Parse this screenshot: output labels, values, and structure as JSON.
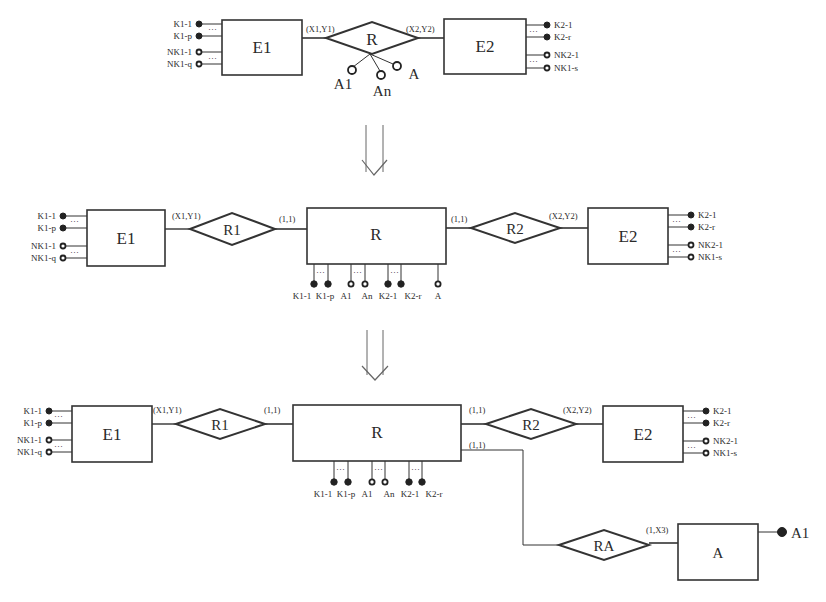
{
  "diagram": {
    "type": "ER schema transformation",
    "stage1": {
      "entity1": "E1",
      "entity2": "E2",
      "relationship": "R",
      "card_left": "(X1,Y1)",
      "card_right": "(X2,Y2)",
      "rel_attrs": [
        "A1",
        "An",
        "A"
      ],
      "e1_attrs": [
        "K1-1",
        "K1-p",
        "NK1-1",
        "NK1-q"
      ],
      "e2_attrs": [
        "K2-1",
        "K2-r",
        "NK2-1",
        "NK1-s"
      ]
    },
    "stage2": {
      "entity1": "E1",
      "entity2": "E2",
      "entity_r": "R",
      "rel1": "R1",
      "rel2": "R2",
      "card_e1": "(X1,Y1)",
      "card_r_left": "(1,1)",
      "card_r_right": "(1,1)",
      "card_e2": "(X2,Y2)",
      "e1_attrs": [
        "K1-1",
        "K1-p",
        "NK1-1",
        "NK1-q"
      ],
      "e2_attrs": [
        "K2-1",
        "K2-r",
        "NK2-1",
        "NK1-s"
      ],
      "r_attrs": [
        "K1-1",
        "K1-p",
        "A1",
        "An",
        "K2-1",
        "K2-r",
        "A"
      ]
    },
    "stage3": {
      "entity1": "E1",
      "entity2": "E2",
      "entity_r": "R",
      "entity_a": "A",
      "rel1": "R1",
      "rel2": "R2",
      "rel_a": "RA",
      "card_e1": "(X1,Y1)",
      "card_r_left": "(1,1)",
      "card_r_right": "(1,1)",
      "card_r_a": "(1,1)",
      "card_e2": "(X2,Y2)",
      "card_a": "(1,X3)",
      "a_attr": "A1",
      "e1_attrs": [
        "K1-1",
        "K1-p",
        "NK1-1",
        "NK1-q"
      ],
      "e2_attrs": [
        "K2-1",
        "K2-r",
        "NK2-1",
        "NK1-s"
      ],
      "r_attrs": [
        "K1-1",
        "K1-p",
        "A1",
        "An",
        "K2-1",
        "K2-r"
      ]
    }
  }
}
